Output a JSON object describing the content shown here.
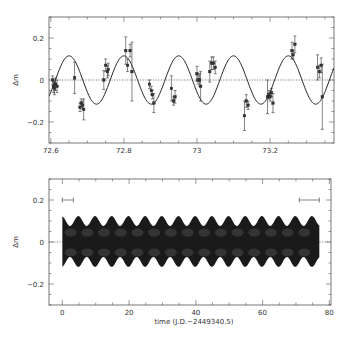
{
  "chart_data": [
    {
      "type": "scatter",
      "panel": "top",
      "title": "",
      "xlabel": "",
      "ylabel": "Δm",
      "xlim": [
        72.595,
        73.375
      ],
      "ylim": [
        -0.3,
        0.3
      ],
      "xticks": [
        72.6,
        72.8,
        73,
        73.2
      ],
      "xtick_labels": [
        "72.6",
        "72.8",
        "73",
        "73.2"
      ],
      "yticks": [
        0.2,
        0,
        -0.2
      ],
      "ytick_labels": [
        "0.2",
        "0",
        "−0.2"
      ],
      "grid": false,
      "reference_line": {
        "y": 0,
        "style": "dotted"
      },
      "model_curve": {
        "type": "sinusoid",
        "amplitude": 0.115,
        "period": 0.15,
        "peak_x": 72.8,
        "description": "solid sinusoidal fit through the data"
      },
      "series": [
        {
          "name": "observations",
          "points": [
            {
              "x": 72.605,
              "y": 0.0,
              "err": 0.02
            },
            {
              "x": 72.607,
              "y": -0.03,
              "err": 0.03
            },
            {
              "x": 72.61,
              "y": -0.04,
              "err": 0.03
            },
            {
              "x": 72.613,
              "y": -0.02,
              "err": 0.03
            },
            {
              "x": 72.617,
              "y": -0.03,
              "err": 0.03
            },
            {
              "x": 72.665,
              "y": 0.01,
              "err": 0.075
            },
            {
              "x": 72.68,
              "y": -0.13,
              "err": 0.02
            },
            {
              "x": 72.683,
              "y": -0.11,
              "err": 0.02
            },
            {
              "x": 72.687,
              "y": -0.12,
              "err": 0.02
            },
            {
              "x": 72.69,
              "y": -0.14,
              "err": 0.05
            },
            {
              "x": 72.745,
              "y": 0.0,
              "err": 0.045
            },
            {
              "x": 72.75,
              "y": 0.07,
              "err": 0.03
            },
            {
              "x": 72.755,
              "y": 0.04,
              "err": 0.03
            },
            {
              "x": 72.757,
              "y": 0.05,
              "err": 0.03
            },
            {
              "x": 72.805,
              "y": 0.14,
              "err": 0.065
            },
            {
              "x": 72.81,
              "y": 0.07,
              "err": 0.03
            },
            {
              "x": 72.817,
              "y": 0.14,
              "err": 0.03
            },
            {
              "x": 72.822,
              "y": 0.04,
              "err": 0.14
            },
            {
              "x": 72.87,
              "y": -0.02,
              "err": 0.02
            },
            {
              "x": 72.875,
              "y": -0.05,
              "err": 0.02
            },
            {
              "x": 72.878,
              "y": -0.07,
              "err": 0.02
            },
            {
              "x": 72.882,
              "y": -0.11,
              "err": 0.045
            },
            {
              "x": 72.93,
              "y": -0.04,
              "err": 0.06
            },
            {
              "x": 72.936,
              "y": -0.1,
              "err": 0.02
            },
            {
              "x": 72.94,
              "y": -0.08,
              "err": 0.03
            },
            {
              "x": 73.0,
              "y": 0.03,
              "err": 0.035
            },
            {
              "x": 73.003,
              "y": 0.0,
              "err": 0.02
            },
            {
              "x": 73.007,
              "y": 0.0,
              "err": 0.03
            },
            {
              "x": 73.01,
              "y": -0.03,
              "err": 0.07
            },
            {
              "x": 73.035,
              "y": 0.04,
              "err": 0.05
            },
            {
              "x": 73.04,
              "y": 0.08,
              "err": 0.03
            },
            {
              "x": 73.045,
              "y": 0.08,
              "err": 0.03
            },
            {
              "x": 73.05,
              "y": 0.06,
              "err": 0.03
            },
            {
              "x": 73.13,
              "y": -0.17,
              "err": 0.07
            },
            {
              "x": 73.135,
              "y": -0.1,
              "err": 0.03
            },
            {
              "x": 73.14,
              "y": -0.12,
              "err": 0.02
            },
            {
              "x": 73.193,
              "y": -0.08,
              "err": 0.08
            },
            {
              "x": 73.197,
              "y": -0.07,
              "err": 0.02
            },
            {
              "x": 73.2,
              "y": -0.08,
              "err": 0.02
            },
            {
              "x": 73.204,
              "y": -0.06,
              "err": 0.02
            },
            {
              "x": 73.208,
              "y": -0.11,
              "err": 0.045
            },
            {
              "x": 73.26,
              "y": 0.14,
              "err": 0.04
            },
            {
              "x": 73.263,
              "y": 0.12,
              "err": 0.02
            },
            {
              "x": 73.268,
              "y": 0.17,
              "err": 0.04
            },
            {
              "x": 73.33,
              "y": 0.06,
              "err": 0.06
            },
            {
              "x": 73.335,
              "y": 0.04,
              "err": 0.03
            },
            {
              "x": 73.34,
              "y": 0.07,
              "err": 0.035
            },
            {
              "x": 73.343,
              "y": -0.08,
              "err": 0.155
            }
          ]
        }
      ]
    },
    {
      "type": "area",
      "panel": "bottom",
      "title": "",
      "xlabel": "time (J.D.−2449340.5)",
      "ylabel": "Δm",
      "xlim": [
        -4,
        80.5
      ],
      "ylim": [
        -0.3,
        0.3
      ],
      "xticks": [
        0,
        20,
        40,
        60,
        80
      ],
      "xtick_labels": [
        "0",
        "20",
        "40",
        "60",
        "80"
      ],
      "yticks": [
        0.2,
        0,
        -0.2
      ],
      "ytick_labels": [
        "0.2",
        "0",
        "−0.2"
      ],
      "grid": false,
      "reference_line": {
        "y": 0,
        "style": "dotted"
      },
      "envelope": {
        "x_start": 0,
        "x_end": 77,
        "mean_amplitude": 0.1,
        "modulation_period_days": 5,
        "modulation_amplitude": 0.02,
        "description": "dense dark band of sinusoidal model curves spanning ~0 to 77 days, with scalloped edges"
      },
      "annotations": [
        {
          "type": "hbar",
          "x_start": 0,
          "x_end": 3.3,
          "y": 0.2,
          "label": "observing window (left)"
        },
        {
          "type": "hbar",
          "x_start": 71,
          "x_end": 77,
          "y": 0.2,
          "label": "observing window (right)"
        }
      ]
    }
  ],
  "labels": {
    "top_ylabel": "Δm",
    "bottom_ylabel": "Δm",
    "bottom_xlabel": "time (J.D.−2449340.5)"
  },
  "colors": {
    "frame": "#555555",
    "curve": "#222222",
    "points": "#333333",
    "band": "#1a1a1a",
    "text": "#333333"
  }
}
